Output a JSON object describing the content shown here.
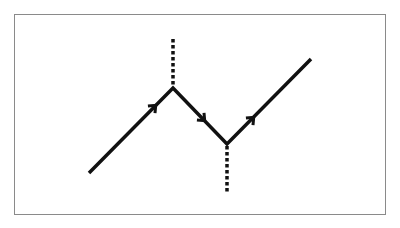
{
  "diagram": {
    "type": "path-with-arrows",
    "frame": {
      "x": 14,
      "y": 14,
      "width": 372,
      "height": 201,
      "stroke": "#8a8a8a"
    },
    "colors": {
      "line": "#111111",
      "dots": "#111111",
      "background": "#ffffff"
    },
    "path": {
      "points": [
        [
          89,
          173
        ],
        [
          173,
          88
        ],
        [
          227,
          144
        ],
        [
          311,
          59
        ]
      ],
      "stroke_width": 3.5
    },
    "arrows": [
      {
        "x": 155,
        "y": 106,
        "direction": "up-right"
      },
      {
        "x": 204,
        "y": 120,
        "direction": "down-right"
      },
      {
        "x": 253,
        "y": 118,
        "direction": "up-right"
      }
    ],
    "dotted_lines": [
      {
        "x": 173,
        "y1": 39,
        "y2": 86,
        "label": "peak-vertical"
      },
      {
        "x": 227,
        "y1": 146,
        "y2": 194,
        "label": "valley-vertical"
      }
    ]
  }
}
